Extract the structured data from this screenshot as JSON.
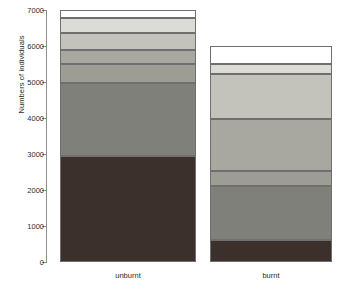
{
  "chart_data": {
    "type": "bar",
    "stacked": true,
    "title": "",
    "xlabel": "",
    "ylabel": "Numbers of individuals",
    "categories": [
      "unburnt",
      "burnt"
    ],
    "ylim": [
      0,
      7000
    ],
    "yticks": [
      0,
      1000,
      2000,
      3000,
      4000,
      5000,
      6000,
      7000
    ],
    "ytick_labels": [
      "0",
      "1000",
      "2000",
      "3000",
      "4000",
      "5000",
      "6000",
      "7000"
    ],
    "grid": false,
    "legend": "none",
    "totals": [
      7000,
      6000
    ],
    "series": [
      {
        "name": "segment-1",
        "color": "#3b302c",
        "values": [
          2950,
          620
        ]
      },
      {
        "name": "segment-2",
        "color": "#80807a",
        "values": [
          2020,
          1480
        ]
      },
      {
        "name": "segment-3",
        "color": "#9d9d95",
        "values": [
          540,
          420
        ]
      },
      {
        "name": "segment-4",
        "color": "#a8a8a0",
        "values": [
          390,
          1450
        ]
      },
      {
        "name": "segment-5",
        "color": "#c3c3bc",
        "values": [
          460,
          1260
        ]
      },
      {
        "name": "segment-6",
        "color": "#dcdcd7",
        "values": [
          430,
          270
        ]
      },
      {
        "name": "segment-7",
        "color": "#ffffff",
        "values": [
          210,
          500
        ]
      }
    ],
    "bars": [
      {
        "category": "unburnt",
        "total": 7000,
        "segments": [
          {
            "name": "segment-1",
            "value": 2950,
            "from": 0,
            "to": 2950,
            "color": "#3b302c"
          },
          {
            "name": "segment-2",
            "value": 2020,
            "from": 2950,
            "to": 4970,
            "color": "#80807a"
          },
          {
            "name": "segment-3",
            "value": 540,
            "from": 4970,
            "to": 5510,
            "color": "#9d9d95"
          },
          {
            "name": "segment-4",
            "value": 390,
            "from": 5510,
            "to": 5900,
            "color": "#a8a8a0"
          },
          {
            "name": "segment-5",
            "value": 460,
            "from": 5900,
            "to": 6360,
            "color": "#c3c3bc"
          },
          {
            "name": "segment-6",
            "value": 430,
            "from": 6360,
            "to": 6790,
            "color": "#dcdcd7"
          },
          {
            "name": "segment-7",
            "value": 210,
            "from": 6790,
            "to": 7000,
            "color": "#ffffff"
          }
        ]
      },
      {
        "category": "burnt",
        "total": 6000,
        "segments": [
          {
            "name": "segment-1",
            "value": 620,
            "from": 0,
            "to": 620,
            "color": "#3b302c"
          },
          {
            "name": "segment-2",
            "value": 1480,
            "from": 620,
            "to": 2100,
            "color": "#80807a"
          },
          {
            "name": "segment-3",
            "value": 420,
            "from": 2100,
            "to": 2520,
            "color": "#9d9d95"
          },
          {
            "name": "segment-4",
            "value": 1450,
            "from": 2520,
            "to": 3970,
            "color": "#a8a8a0"
          },
          {
            "name": "segment-5",
            "value": 1260,
            "from": 3970,
            "to": 5230,
            "color": "#c3c3bc"
          },
          {
            "name": "segment-6",
            "value": 270,
            "from": 5230,
            "to": 5500,
            "color": "#dcdcd7"
          },
          {
            "name": "segment-7",
            "value": 500,
            "from": 5500,
            "to": 6000,
            "color": "#ffffff"
          }
        ]
      }
    ],
    "axis_color": "#8d8d8d",
    "segment_border_color": "#6f6f6f",
    "text_color": "#2b2b2b"
  }
}
